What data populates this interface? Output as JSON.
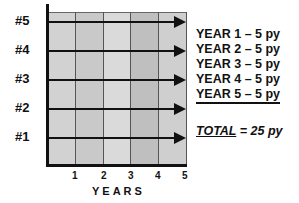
{
  "diagram": {
    "rows": [
      {
        "label": "#5",
        "y": 22
      },
      {
        "label": "#4",
        "y": 51
      },
      {
        "label": "#3",
        "y": 80
      },
      {
        "label": "#2",
        "y": 109
      },
      {
        "label": "#1",
        "y": 138
      }
    ],
    "x_ticks": [
      "1",
      "2",
      "3",
      "4",
      "5"
    ],
    "x_title": "YEARS",
    "column_shades": [
      "#d2d2d2",
      "#c9c9c9",
      "#dadada",
      "#bfbfbf",
      "#cfcfcf"
    ],
    "legend": [
      "YEAR 1 – 5 py",
      "YEAR 2 – 5 py",
      "YEAR 3 – 5 py",
      "YEAR 4 – 5 py",
      "YEAR 5 – 5 py"
    ],
    "total_label": "TOTAL",
    "total_value": " = 25 py"
  }
}
